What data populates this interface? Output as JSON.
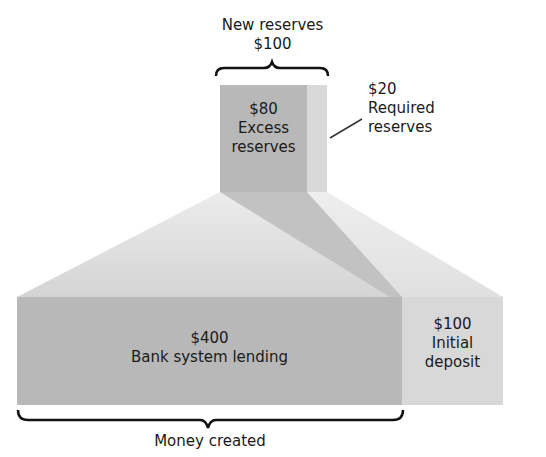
{
  "diagram": {
    "new_reserves": {
      "title": "New reserves",
      "value": "$100"
    },
    "excess_reserves": {
      "value": "$80",
      "line1": "Excess",
      "line2": "reserves"
    },
    "required_reserves": {
      "value": "$20",
      "line1": "Required",
      "line2": "reserves"
    },
    "bank_lending": {
      "value": "$400",
      "label": "Bank system lending"
    },
    "initial_deposit": {
      "value": "$100",
      "line1": "Initial",
      "line2": "deposit"
    },
    "money_created": {
      "label": "Money created"
    }
  },
  "colors": {
    "dark_block": "#b5b5b5",
    "light_block": "#d6d6d6",
    "slope_light": "#dedede",
    "slope_dark": "#c4c4c4",
    "text": "#1a1a1a"
  }
}
